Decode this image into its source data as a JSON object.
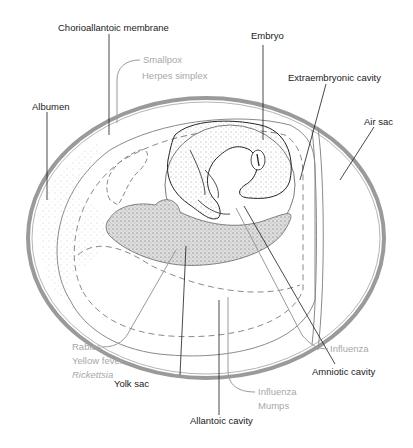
{
  "labels": {
    "chorioallantoic_membrane": "Chorioallantoic membrane",
    "embryo": "Embryo",
    "extraembryonic_cavity": "Extraembryonic cavity",
    "air_sac": "Air sac",
    "albumen": "Albumen",
    "yolk_sac": "Yolk sac",
    "amniotic_cavity": "Amniotic cavity",
    "allantoic_cavity": "Allantoic cavity"
  },
  "inoculation_sites": {
    "chorioallantoic": [
      "Smallpox",
      "Herpes simplex"
    ],
    "yolk_sac": [
      "Rabies",
      "Yellow fever",
      "Rickettsia"
    ],
    "amniotic": [
      "Influenza"
    ],
    "allantoic": [
      "Influenza",
      "Mumps"
    ]
  },
  "colors": {
    "label_text": "#1a1a1a",
    "pathogen_text": "#a8a8a8",
    "shell": "#9a9a9a",
    "yolk_fill": "#d9d9d9",
    "membrane": "#8a8a8a"
  }
}
